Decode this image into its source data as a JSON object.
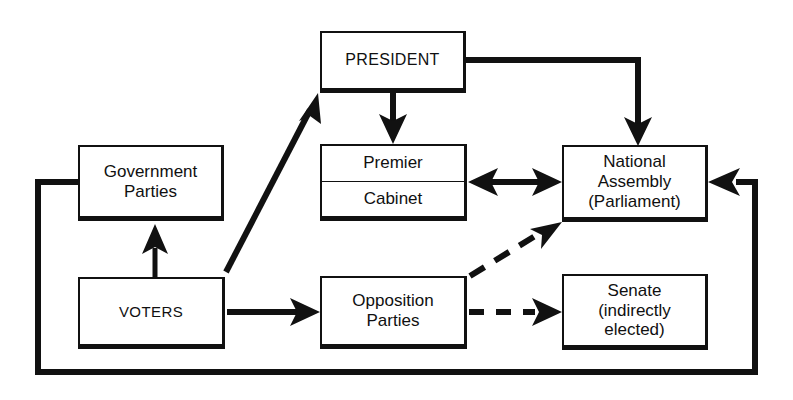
{
  "diagram": {
    "colors": {
      "line": "#111111",
      "box_border": "#111111",
      "background": "#ffffff",
      "text": "#101010"
    },
    "nodes": [
      {
        "id": "president",
        "label": "PRESIDENT"
      },
      {
        "id": "government",
        "label": "Government\nParties"
      },
      {
        "id": "premier",
        "label": "Premier"
      },
      {
        "id": "cabinet",
        "label": "Cabinet"
      },
      {
        "id": "assembly",
        "label": "National\nAssembly\n(Parliament)"
      },
      {
        "id": "voters",
        "label": "VOTERS"
      },
      {
        "id": "opposition",
        "label": "Opposition\nParties"
      },
      {
        "id": "senate",
        "label": "Senate\n(indirectly\nelected)"
      }
    ],
    "edges": [
      {
        "id": "president-to-assembly",
        "from": "president",
        "to": "assembly",
        "style": "solid",
        "arrow": "single"
      },
      {
        "id": "president-to-premier",
        "from": "president",
        "to": "premier",
        "style": "solid",
        "arrow": "single"
      },
      {
        "id": "voters-to-president",
        "from": "voters",
        "to": "president",
        "style": "solid",
        "arrow": "single"
      },
      {
        "id": "voters-to-government",
        "from": "voters",
        "to": "government",
        "style": "solid",
        "arrow": "single"
      },
      {
        "id": "voters-to-opposition",
        "from": "voters",
        "to": "opposition",
        "style": "solid",
        "arrow": "single"
      },
      {
        "id": "cabinet-assembly",
        "from": "premier",
        "to": "assembly",
        "style": "solid",
        "arrow": "double"
      },
      {
        "id": "opposition-to-assembly",
        "from": "opposition",
        "to": "assembly",
        "style": "dashed",
        "arrow": "single"
      },
      {
        "id": "opposition-to-senate",
        "from": "opposition",
        "to": "senate",
        "style": "dashed",
        "arrow": "single"
      },
      {
        "id": "assembly-to-government",
        "from": "assembly",
        "to": "government",
        "style": "solid",
        "arrow": "single"
      }
    ]
  }
}
